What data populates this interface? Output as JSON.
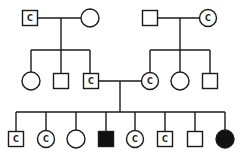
{
  "legend": {
    "square": "male",
    "circle": "female",
    "filled": "affected",
    "C": "carrier"
  },
  "colors": {
    "line": "#1a1a1a",
    "affected_fill": "#111111",
    "unaffected_fill": "#ffffff"
  },
  "generations": [
    {
      "name": "I",
      "individuals": [
        {
          "id": "I-1",
          "sex": "male",
          "status": "carrier",
          "label": "C",
          "x": 30,
          "y": 18
        },
        {
          "id": "I-2",
          "sex": "female",
          "status": "unaffected",
          "label": "",
          "x": 90,
          "y": 18
        },
        {
          "id": "I-3",
          "sex": "male",
          "status": "unaffected",
          "label": "",
          "x": 150,
          "y": 18
        },
        {
          "id": "I-4",
          "sex": "female",
          "status": "carrier",
          "label": "C",
          "x": 208,
          "y": 18
        }
      ]
    },
    {
      "name": "II",
      "individuals": [
        {
          "id": "II-1",
          "sex": "female",
          "status": "unaffected",
          "label": "",
          "x": 31,
          "y": 81
        },
        {
          "id": "II-2",
          "sex": "male",
          "status": "unaffected",
          "label": "",
          "x": 61,
          "y": 81
        },
        {
          "id": "II-3",
          "sex": "male",
          "status": "carrier",
          "label": "C",
          "x": 90,
          "y": 81
        },
        {
          "id": "II-4",
          "sex": "female",
          "status": "carrier",
          "label": "C",
          "x": 150,
          "y": 81
        },
        {
          "id": "II-5",
          "sex": "female",
          "status": "unaffected",
          "label": "",
          "x": 180,
          "y": 81
        },
        {
          "id": "II-6",
          "sex": "male",
          "status": "unaffected",
          "label": "",
          "x": 210,
          "y": 81
        }
      ]
    },
    {
      "name": "III",
      "individuals": [
        {
          "id": "III-1",
          "sex": "male",
          "status": "carrier",
          "label": "C",
          "x": 16,
          "y": 139
        },
        {
          "id": "III-2",
          "sex": "female",
          "status": "carrier",
          "label": "C",
          "x": 46,
          "y": 139
        },
        {
          "id": "III-3",
          "sex": "female",
          "status": "unaffected",
          "label": "",
          "x": 76,
          "y": 139
        },
        {
          "id": "III-4",
          "sex": "male",
          "status": "affected",
          "label": "",
          "x": 106,
          "y": 139
        },
        {
          "id": "III-5",
          "sex": "female",
          "status": "carrier",
          "label": "C",
          "x": 135,
          "y": 139
        },
        {
          "id": "III-6",
          "sex": "male",
          "status": "carrier",
          "label": "C",
          "x": 165,
          "y": 139
        },
        {
          "id": "III-7",
          "sex": "male",
          "status": "unaffected",
          "label": "",
          "x": 195,
          "y": 139
        },
        {
          "id": "III-8",
          "sex": "female",
          "status": "affected",
          "label": "",
          "x": 225,
          "y": 139
        }
      ]
    }
  ],
  "marriages": [
    {
      "partners": [
        "I-1",
        "I-2"
      ],
      "children": [
        "II-1",
        "II-2",
        "II-3"
      ]
    },
    {
      "partners": [
        "I-3",
        "I-4"
      ],
      "children": [
        "II-4",
        "II-5",
        "II-6"
      ]
    },
    {
      "partners": [
        "II-3",
        "II-4"
      ],
      "children": [
        "III-1",
        "III-2",
        "III-3",
        "III-4",
        "III-5",
        "III-6",
        "III-7",
        "III-8"
      ]
    }
  ]
}
